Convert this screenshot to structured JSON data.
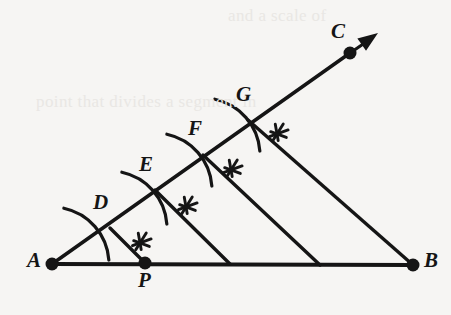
{
  "figure": {
    "background_color": "#f6f5f3",
    "ink_color": "#151515",
    "width": 451,
    "height": 315
  },
  "ghost_text": [
    {
      "text": "and a scale of",
      "x": 228,
      "y": 6
    },
    {
      "text": "point that divides a segment in",
      "x": 36,
      "y": 92
    }
  ],
  "points": [
    {
      "id": "A",
      "label": "A",
      "x": 52,
      "y": 264,
      "dot": true,
      "label_x": 27,
      "label_y": 248
    },
    {
      "id": "B",
      "label": "B",
      "x": 413,
      "y": 265,
      "dot": true,
      "label_x": 424,
      "label_y": 248
    },
    {
      "id": "C",
      "label": "C",
      "x": 350,
      "y": 53,
      "dot": true,
      "label_x": 331,
      "label_y": 19
    },
    {
      "id": "P",
      "label": "P",
      "x": 145,
      "y": 263,
      "dot": true,
      "label_x": 138,
      "label_y": 268
    },
    {
      "id": "D",
      "label": "D",
      "x": 110,
      "y": 228,
      "dot": false,
      "label_x": 93,
      "label_y": 190
    },
    {
      "id": "E",
      "label": "E",
      "x": 155,
      "y": 190,
      "dot": false,
      "label_x": 139,
      "label_y": 152
    },
    {
      "id": "F",
      "label": "F",
      "x": 203,
      "y": 155,
      "dot": false,
      "label_x": 188,
      "label_y": 116
    },
    {
      "id": "G",
      "label": "G",
      "x": 248,
      "y": 120,
      "dot": false,
      "label_x": 236,
      "label_y": 82
    }
  ],
  "segments": [
    {
      "name": "base-ab",
      "x1": 52,
      "y1": 264,
      "x2": 413,
      "y2": 265,
      "width": 4.2
    },
    {
      "name": "ray-ac",
      "x1": 52,
      "y1": 264,
      "x2": 350,
      "y2": 53,
      "width": 3.6
    },
    {
      "name": "ray-arrow-shaft",
      "x1": 350,
      "y1": 53,
      "x2": 372,
      "y2": 38,
      "width": 3.2
    },
    {
      "name": "transversal-pd",
      "x1": 145,
      "y1": 263,
      "x2": 110,
      "y2": 228,
      "width": 3.4
    },
    {
      "name": "transversal-e",
      "x1": 230,
      "y1": 264,
      "x2": 155,
      "y2": 190,
      "width": 3.4
    },
    {
      "name": "transversal-f",
      "x1": 320,
      "y1": 265,
      "x2": 203,
      "y2": 155,
      "width": 3.4
    },
    {
      "name": "transversal-gb",
      "x1": 413,
      "y1": 265,
      "x2": 248,
      "y2": 120,
      "width": 3.4
    }
  ],
  "arrow": {
    "name": "direction-arrowhead",
    "tip_x": 378,
    "tip_y": 33,
    "angle_deg": -35.3
  },
  "compass_arcs": [
    {
      "name": "arc-at-A",
      "cx": 52,
      "cy": 264,
      "r": 57,
      "start_deg": -78,
      "end_deg": -4
    },
    {
      "name": "arc-at-D",
      "cx": 110,
      "cy": 228,
      "r": 57,
      "start_deg": -78,
      "end_deg": -4
    },
    {
      "name": "arc-at-E",
      "cx": 155,
      "cy": 190,
      "r": 57,
      "start_deg": -78,
      "end_deg": -4
    },
    {
      "name": "arc-at-F",
      "cx": 203,
      "cy": 155,
      "r": 57,
      "start_deg": -78,
      "end_deg": -4
    }
  ],
  "tick_marks": [
    {
      "name": "tick-cluster-P",
      "cx": 140,
      "cy": 243,
      "angle_deg": -38
    },
    {
      "name": "tick-cluster-D",
      "cx": 186,
      "cy": 207,
      "angle_deg": -38
    },
    {
      "name": "tick-cluster-E",
      "cx": 231,
      "cy": 170,
      "angle_deg": -38
    },
    {
      "name": "tick-cluster-F",
      "cx": 277,
      "cy": 134,
      "angle_deg": -38
    }
  ],
  "chart_data": {
    "type": "diagram",
    "equal_segments_on_ray": [
      "AD",
      "DE",
      "EF",
      "FG"
    ],
    "parallel_lines": [
      "GB",
      "F-to-base",
      "E-to-base",
      "D-to-P"
    ],
    "base_division_points_x": [
      52,
      145,
      230,
      320,
      413
    ],
    "ratio": "AP : PB = 1 : 3"
  }
}
